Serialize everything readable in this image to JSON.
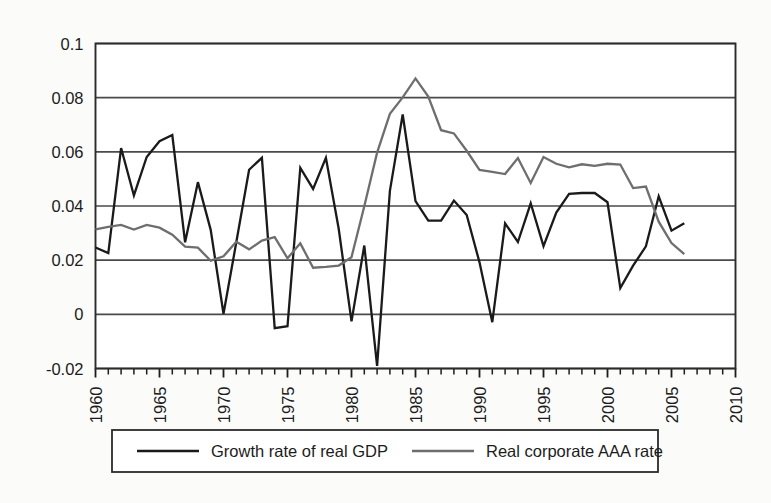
{
  "chart_data": {
    "type": "line",
    "title": "",
    "subtitle": "",
    "xlabel": "",
    "ylabel": "",
    "xlim": [
      1960,
      2010
    ],
    "ylim": [
      -0.02,
      0.1
    ],
    "xticks": [
      1960,
      1965,
      1970,
      1975,
      1980,
      1985,
      1990,
      1995,
      2000,
      2005,
      2010
    ],
    "xticklabels": [
      "1960",
      "1965",
      "1970",
      "1975",
      "1980",
      "1985",
      "1990",
      "1995",
      "2000",
      "2005",
      "2010"
    ],
    "minor_xtick_interval": 1,
    "yticks": [
      -0.02,
      0,
      0.02,
      0.04,
      0.06,
      0.08,
      0.1
    ],
    "yticklabels": [
      "-0.02",
      "0",
      "0.02",
      "0.04",
      "0.06",
      "0.08",
      "0.1"
    ],
    "grid": "horizontal",
    "legend_position": "bottom-outside",
    "x": [
      1960,
      1961,
      1962,
      1963,
      1964,
      1965,
      1966,
      1967,
      1968,
      1969,
      1970,
      1971,
      1972,
      1973,
      1974,
      1975,
      1976,
      1977,
      1978,
      1979,
      1980,
      1981,
      1982,
      1983,
      1984,
      1985,
      1986,
      1987,
      1988,
      1989,
      1990,
      1991,
      1992,
      1993,
      1994,
      1995,
      1996,
      1997,
      1998,
      1999,
      2000,
      2001,
      2002,
      2003,
      2004,
      2005,
      2006
    ],
    "series": [
      {
        "name": "Growth rate of real GDP",
        "color": "#1a1a1a",
        "width": 2.3,
        "values": [
          0.0247,
          0.0226,
          0.0614,
          0.0439,
          0.0581,
          0.0639,
          0.0662,
          0.0266,
          0.0488,
          0.0312,
          0.0002,
          0.0266,
          0.0534,
          0.0578,
          -0.0051,
          -0.0044,
          0.0541,
          0.0463,
          0.0578,
          0.0316,
          -0.0026,
          0.0254,
          -0.019,
          0.0456,
          0.0738,
          0.0418,
          0.0346,
          0.0346,
          0.042,
          0.0367,
          0.0192,
          -0.0029,
          0.0336,
          0.0267,
          0.041,
          0.0252,
          0.0376,
          0.0445,
          0.0448,
          0.0448,
          0.0414,
          0.0097,
          0.018,
          0.0251,
          0.0436,
          0.0309,
          0.0336
        ]
      },
      {
        "name": "Real corporate AAA rate",
        "color": "#6e6e6e",
        "width": 2.3,
        "values": [
          0.0314,
          0.0323,
          0.033,
          0.0313,
          0.033,
          0.032,
          0.0294,
          0.025,
          0.0246,
          0.0198,
          0.0214,
          0.0268,
          0.024,
          0.0272,
          0.0285,
          0.0207,
          0.0262,
          0.0172,
          0.0175,
          0.018,
          0.0211,
          0.0399,
          0.0597,
          0.074,
          0.0801,
          0.0871,
          0.0804,
          0.068,
          0.0668,
          0.0604,
          0.0533,
          0.0526,
          0.0518,
          0.0577,
          0.0485,
          0.0581,
          0.0556,
          0.0543,
          0.0554,
          0.0548,
          0.0556,
          0.0553,
          0.0466,
          0.0472,
          0.0342,
          0.0263,
          0.0222
        ]
      }
    ],
    "legend": [
      {
        "label": "Growth rate of real GDP",
        "color": "#1a1a1a"
      },
      {
        "label": "Real corporate AAA rate",
        "color": "#6e6e6e"
      }
    ]
  }
}
